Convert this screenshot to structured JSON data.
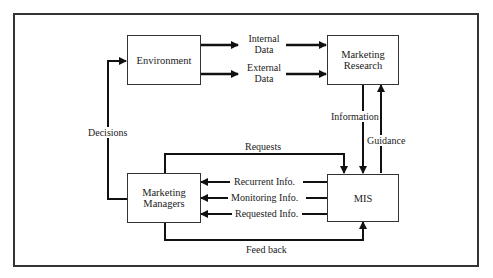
{
  "diagram": {
    "nodes": {
      "environment": {
        "label": "Environment"
      },
      "marketing_research": {
        "label_line1": "Marketing",
        "label_line2": "Research"
      },
      "marketing_managers": {
        "label_line1": "Marketing",
        "label_line2": "Managers"
      },
      "mis": {
        "label": "MIS"
      }
    },
    "edges": {
      "internal_data": {
        "line1": "Internal",
        "line2": "Data",
        "from": "Environment",
        "to": "Marketing Research"
      },
      "external_data": {
        "line1": "External",
        "line2": "Data",
        "from": "Environment",
        "to": "Marketing Research"
      },
      "information": {
        "label": "Information",
        "from": "Marketing Research",
        "to": "MIS"
      },
      "guidance": {
        "label": "Guidance",
        "from": "MIS",
        "to": "Marketing Research"
      },
      "requests": {
        "label": "Requests",
        "from": "Marketing Managers",
        "to": "MIS"
      },
      "recurrent_info": {
        "label": "Recurrent Info.",
        "from": "MIS",
        "to": "Marketing Managers"
      },
      "monitoring_info": {
        "label": "Monitoring Info.",
        "from": "MIS",
        "to": "Marketing Managers"
      },
      "requested_info": {
        "label": "Requested Info.",
        "from": "MIS",
        "to": "Marketing Managers"
      },
      "feed_back": {
        "label": "Feed back",
        "from": "Marketing Managers",
        "to": "MIS"
      },
      "decisions": {
        "label": "Decisions",
        "from": "Marketing Managers",
        "to": "Environment"
      }
    }
  }
}
